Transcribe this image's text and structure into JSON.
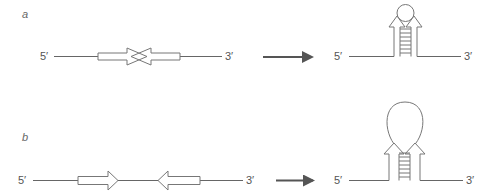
{
  "panels": [
    {
      "id": "a",
      "label": "a",
      "before": {
        "five_prime": "5′",
        "three_prime": "3′",
        "description": "inverted repeats adjacent, arrowheads overlapping"
      },
      "after": {
        "five_prime": "5′",
        "three_prime": "3′",
        "description": "short hairpin with small loop"
      }
    },
    {
      "id": "b",
      "label": "b",
      "before": {
        "five_prime": "5′",
        "three_prime": "3′",
        "description": "inverted repeats separated by spacer"
      },
      "after": {
        "five_prime": "5′",
        "three_prime": "3′",
        "description": "hairpin with large loop"
      }
    }
  ],
  "colors": {
    "strand": "#666666",
    "process_arrow": "#555555",
    "text": "#555555"
  }
}
